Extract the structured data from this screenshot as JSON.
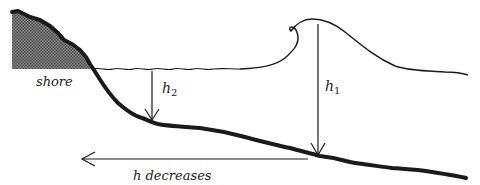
{
  "diagram": {
    "labels": {
      "shore": "shore",
      "h2": "h",
      "h2_sub": "2",
      "h1": "h",
      "h1_sub": "1",
      "direction": "h decreases"
    },
    "colors": {
      "ink": "#1a1a1a",
      "shore_fill": "#6e6e6e",
      "background": "#ffffff"
    }
  }
}
